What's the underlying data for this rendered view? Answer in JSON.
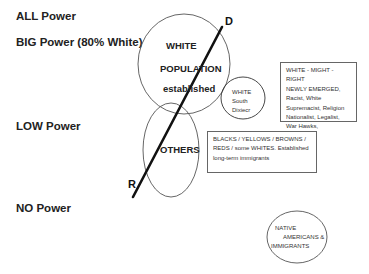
{
  "levels": {
    "all": "ALL Power",
    "big": "BIG Power (80% White)",
    "low": "LOW Power",
    "none": "NO Power"
  },
  "circles": {
    "white_population": [
      "WHITE",
      "POPULATION",
      "established"
    ],
    "others": "OTHERS",
    "white_south": [
      "WHITE",
      "South",
      "Dixiecr"
    ],
    "native": [
      "NATIVE",
      "AMERICANS &",
      "IMMIGRANTS"
    ]
  },
  "boxes": {
    "might_right": [
      "WHITE - MIGHT - RIGHT",
      "NEWLY EMERGED,",
      "Racist, White",
      "Supremacist, Religion",
      "Nationalist, Legalist,",
      "War Hawks,"
    ],
    "others_desc": [
      "BLACKS / YELLOWS / BROWNS /",
      "REDS / some WHITES. Established",
      "long-term immigrants"
    ]
  },
  "axis": {
    "top_label": "D",
    "bottom_label": "R"
  },
  "colors": {
    "line": "#111111",
    "circle_stroke": "#555555",
    "box_stroke": "#666666"
  }
}
